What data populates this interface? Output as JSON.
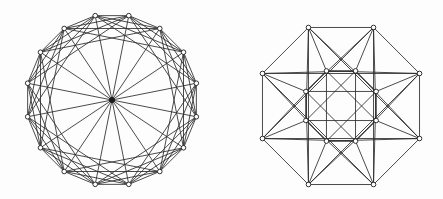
{
  "figure": {
    "title": "",
    "background_color": "#fdfdfd",
    "edge_color": "#2b2b2b",
    "vertex_fill": "#ffffff",
    "vertex_stroke": "#1e1e1e",
    "hub_fill": "#1a1a1a",
    "edge_width": 0.85,
    "vertex_radius": 2.3,
    "hub_radius": 2.6,
    "width": 443,
    "height": 199,
    "panels": [
      {
        "name": "left-graph",
        "label": "",
        "layout": "wheel-circulant",
        "center": [
          112,
          100
        ],
        "radius": 86,
        "outer_vertex_count": 16,
        "has_center_hub": true,
        "start_angle_deg": -101.25,
        "chord_steps": [
          1,
          2,
          3,
          4
        ],
        "hub_spokes": 16
      },
      {
        "name": "right-graph",
        "label": "",
        "layout": "double-octagon",
        "center": [
          341,
          106
        ],
        "outer_radius": 85,
        "inner_radius": 38,
        "outer_vertex_count": 8,
        "inner_vertex_count": 8,
        "has_center_hub": false,
        "outer_start_angle_deg": -112.5,
        "inner_start_angle_deg": -112.5,
        "outer_chord_steps": [
          1,
          3
        ],
        "inner_chord_steps": [
          1,
          3
        ],
        "radial_steps": [
          0
        ],
        "cross_steps": [
          2
        ]
      }
    ]
  },
  "chart_data": {
    "type": "diagram",
    "xlabel": "",
    "ylabel": "",
    "graphs": [
      {
        "name": "left-graph",
        "vertices": 17,
        "description": "16 vertices arranged on a circle plus one central hub vertex joined to all of them; circular vertices also joined to neighbours at distances 1, 2, 3 and 4 around the ring.",
        "ring_size": 16,
        "connection_set": [
          1,
          2,
          3,
          4
        ],
        "hub": true,
        "degree_ring": 9,
        "degree_hub": 16
      },
      {
        "name": "right-graph",
        "vertices": 16,
        "description": "Two concentric octagons; each octagon has its 8 vertices joined at distances 1 and 3, and corresponding inner/outer vertices are joined radially with additional crossing chords at distance 2.",
        "outer_ring_size": 8,
        "inner_ring_size": 8,
        "outer_connection_set": [
          1,
          3
        ],
        "inner_connection_set": [
          1,
          3
        ],
        "radial_connection_set": [
          0
        ],
        "cross_connection_set": [
          2
        ]
      }
    ]
  }
}
